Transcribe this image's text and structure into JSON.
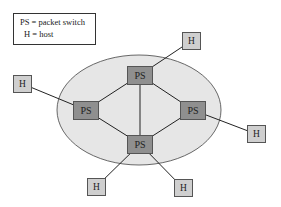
{
  "legend": {
    "line1": "PS = packet switch",
    "line2": "H = host"
  },
  "nodes": {
    "ps_top": {
      "label": "PS"
    },
    "ps_left": {
      "label": "PS"
    },
    "ps_right": {
      "label": "PS"
    },
    "ps_bottom": {
      "label": "PS"
    },
    "h_top_right": {
      "label": "H"
    },
    "h_left": {
      "label": "H"
    },
    "h_right": {
      "label": "H"
    },
    "h_bottom_left": {
      "label": "H"
    },
    "h_bottom_right": {
      "label": "H"
    }
  },
  "colors": {
    "network_fill": "#e6e6e6",
    "packet_switch": "#8f8f8f",
    "host": "#cfcfcf",
    "link": "#222222"
  },
  "edges": [
    [
      "ps_top",
      "ps_left"
    ],
    [
      "ps_top",
      "ps_right"
    ],
    [
      "ps_top",
      "ps_bottom"
    ],
    [
      "ps_left",
      "ps_bottom"
    ],
    [
      "ps_right",
      "ps_bottom"
    ],
    [
      "ps_top",
      "h_top_right"
    ],
    [
      "ps_left",
      "h_left"
    ],
    [
      "ps_right",
      "h_right"
    ],
    [
      "ps_bottom",
      "h_bottom_left"
    ],
    [
      "ps_bottom",
      "h_bottom_right"
    ]
  ]
}
